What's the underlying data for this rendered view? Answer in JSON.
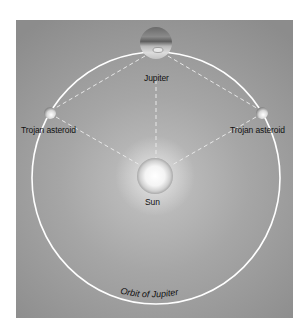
{
  "diagram": {
    "type": "orbital-diagram",
    "colors": {
      "background": "#9a9a9a",
      "orbit": "#ffffff",
      "dashed_lines": "#e6e6e6",
      "label_text": "#111111"
    },
    "nodes": [
      {
        "id": "jupiter",
        "label": "Jupiter",
        "x": 156,
        "y": 43,
        "r": 16
      },
      {
        "id": "sun",
        "label": "Sun",
        "x": 155,
        "y": 176,
        "r": 18
      },
      {
        "id": "trojan-left",
        "label": "Trojan asteroid",
        "x": 50,
        "y": 113,
        "r": 6
      },
      {
        "id": "trojan-right",
        "label": "Trojan asteroid",
        "x": 262,
        "y": 113,
        "r": 6
      }
    ],
    "orbit": {
      "label": "Orbit of Jupiter",
      "cx": 156,
      "cy": 178,
      "rx": 124,
      "ry": 126
    },
    "edges": [
      {
        "from": "jupiter",
        "to": "trojan-left",
        "style": "dashed"
      },
      {
        "from": "jupiter",
        "to": "trojan-right",
        "style": "dashed"
      },
      {
        "from": "jupiter",
        "to": "sun",
        "style": "dashed"
      },
      {
        "from": "sun",
        "to": "trojan-left",
        "style": "dashed"
      },
      {
        "from": "sun",
        "to": "trojan-right",
        "style": "dashed"
      }
    ]
  },
  "labels": {
    "jupiter": "Jupiter",
    "sun": "Sun",
    "trojan_left": "Trojan asteroid",
    "trojan_right": "Trojan asteroid",
    "orbit": "Orbit of Jupiter"
  }
}
